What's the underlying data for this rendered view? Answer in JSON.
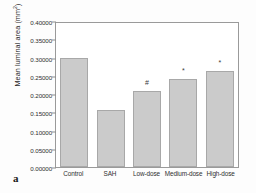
{
  "panel": {
    "label": "a"
  },
  "chart_data": {
    "type": "bar",
    "title": "",
    "xlabel": "",
    "ylabel": "Mean luminal area (mm2)",
    "ylabel_text": "Mean luminal area (mm",
    "ylabel_sup": "2",
    "ylabel_tail": ")",
    "categories": [
      "Control",
      "SAH",
      "Low-dose",
      "Medium-dose",
      "High-dose"
    ],
    "values": [
      0.3,
      0.155,
      0.207,
      0.241,
      0.262
    ],
    "annotations": [
      "",
      "",
      "#",
      "*",
      "*"
    ],
    "ylim": [
      0.0,
      0.4
    ],
    "ytick_values": [
      0.0,
      0.05,
      0.1,
      0.15,
      0.2,
      0.25,
      0.3,
      0.35,
      0.4
    ],
    "ytick_labels": [
      "0.00000",
      "0.05000",
      "0.10000",
      "0.15000",
      "0.20000",
      "0.25000",
      "0.30000",
      "0.35000",
      "0.40000"
    ],
    "grid": false,
    "legend": "none",
    "bar_color": "#cbcbcb",
    "bar_edge_color": "#a8a8a8",
    "axis_color": "#9a9a9a"
  }
}
